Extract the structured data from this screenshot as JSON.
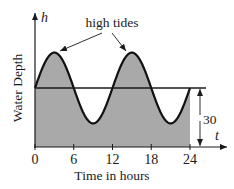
{
  "chart_data": {
    "type": "area",
    "title": "",
    "xlabel": "Time in hours",
    "ylabel": "Water Depth",
    "x_axis_symbol": "t",
    "y_axis_symbol": "h",
    "x_ticks": [
      0,
      6,
      12,
      18,
      24
    ],
    "x_tick_labels": [
      "0",
      "6",
      "12",
      "18",
      "24"
    ],
    "xlim": [
      0,
      24
    ],
    "grid": false,
    "legend": null,
    "annotations": [
      {
        "text": "high tides",
        "points_to": [
          {
            "x": 3,
            "y": 48
          },
          {
            "x": 15,
            "y": 48
          }
        ]
      },
      {
        "text": "30",
        "type": "dimension",
        "from": 0,
        "to": 30,
        "description": "midline depth"
      }
    ],
    "midline": 30,
    "amplitude": 18,
    "period": 12,
    "series": [
      {
        "name": "Water Depth",
        "x": [
          0,
          3,
          6,
          9,
          12,
          15,
          18,
          21,
          24
        ],
        "values": [
          30,
          48,
          30,
          12,
          30,
          48,
          30,
          12,
          30
        ]
      }
    ],
    "colors": {
      "fill": "#a9a9a9",
      "line": "#111111",
      "axis": "#1a1a1a"
    }
  }
}
